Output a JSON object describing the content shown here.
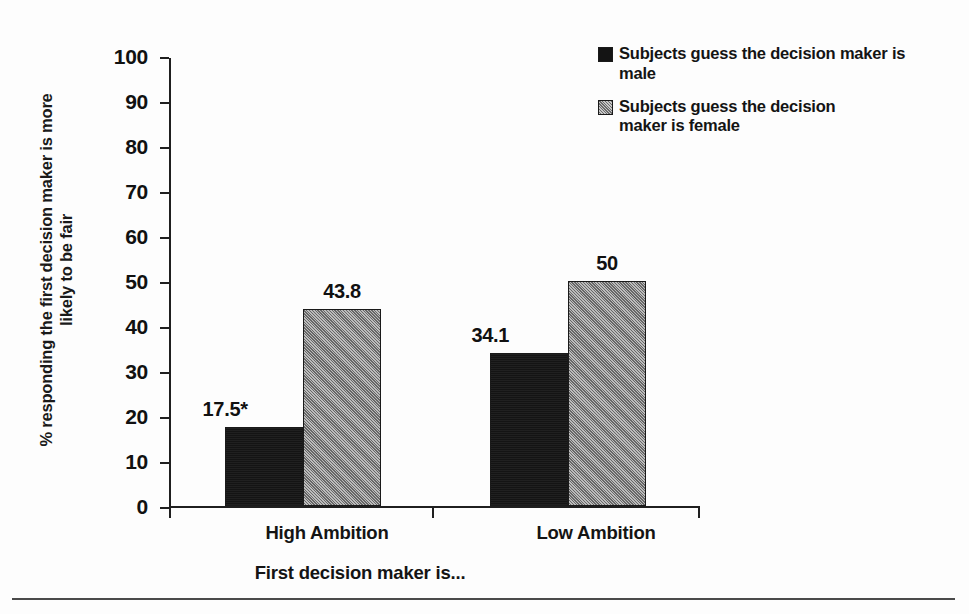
{
  "chart_data": {
    "type": "bar",
    "title": "",
    "xlabel": "First decision maker is...",
    "ylabel": "% responding the first decision maker is more likely to be fair",
    "categories": [
      "High Ambition",
      "Low Ambition"
    ],
    "series": [
      {
        "name": "Subjects guess the decision maker is male",
        "values": [
          17.5,
          34.1
        ],
        "labels": [
          "17.5*",
          "34.1"
        ],
        "color": "#141414"
      },
      {
        "name": "Subjects guess the decision maker is female",
        "values": [
          43.8,
          50
        ],
        "labels": [
          "43.8",
          "50"
        ],
        "color": "#8f8f8f"
      }
    ],
    "ylim": [
      0,
      100
    ],
    "ytick_step": 10,
    "yticks": [
      0,
      10,
      20,
      30,
      40,
      50,
      60,
      70,
      80,
      90,
      100
    ],
    "ytick_labels": [
      "0",
      "10",
      "20",
      "30",
      "40",
      "50",
      "60",
      "70",
      "80",
      "90",
      "100"
    ],
    "grid": false,
    "legend_position": "top-right",
    "annotations": [
      "* denotes statistical significance marker on the High Ambition male bar"
    ]
  },
  "axis": {
    "ylabel_line1": "% responding the first decision maker is more",
    "ylabel_line2": "likely to be fair",
    "xlabel": "First decision maker is..."
  },
  "legend": {
    "items": [
      {
        "label": "Subjects guess the decision maker is male",
        "swatch": "black-square-icon"
      },
      {
        "label": "Subjects guess the decision maker is female",
        "swatch": "gray-square-icon"
      }
    ]
  }
}
